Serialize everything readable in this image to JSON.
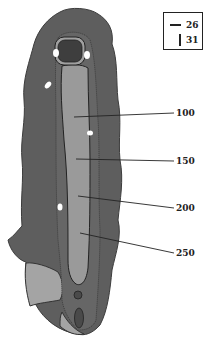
{
  "diagram": {
    "type": "golf-hole-layout",
    "colors": {
      "rough": "#5e5e5e",
      "rough_edge": "#3c3c3c",
      "fairway": "#9a9a9a",
      "tee": "#3e3e3e",
      "green_area": "#a4a4a4",
      "bunker": "#ffffff",
      "line": "#222222"
    },
    "legend": {
      "items": [
        {
          "symbol": "horizontal-line",
          "value": "26"
        },
        {
          "symbol": "vertical-line",
          "value": "31"
        }
      ]
    },
    "distance_markers": [
      {
        "label": "100"
      },
      {
        "label": "150"
      },
      {
        "label": "200"
      },
      {
        "label": "250"
      }
    ]
  }
}
